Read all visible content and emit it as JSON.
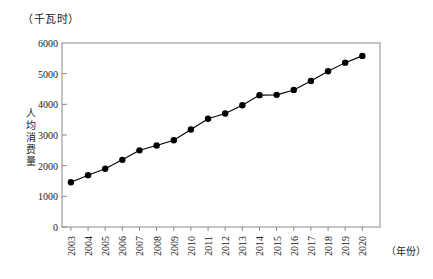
{
  "chart_data": {
    "type": "line",
    "title": "",
    "unit_label": "（千瓦时）",
    "xlabel": "（年份）",
    "ylabel": "人均消费量",
    "categories": [
      "2003",
      "2004",
      "2005",
      "2006",
      "2007",
      "2008",
      "2009",
      "2010",
      "2011",
      "2012",
      "2013",
      "2014",
      "2015",
      "2016",
      "2017",
      "2018",
      "2019",
      "2020"
    ],
    "values": [
      1460,
      1690,
      1900,
      2190,
      2500,
      2660,
      2830,
      3180,
      3530,
      3700,
      3970,
      4300,
      4310,
      4470,
      4760,
      5080,
      5360,
      5580
    ],
    "ylim": [
      0,
      6000
    ],
    "yticks": [
      "0",
      "1000",
      "2000",
      "3000",
      "4000",
      "5000",
      "6000"
    ],
    "ytick_values": [
      0,
      1000,
      2000,
      3000,
      4000,
      5000,
      6000
    ],
    "grid": false,
    "legend": null,
    "marker": "filled-circle",
    "series_color": "#000000",
    "frame_color": "#888888"
  }
}
